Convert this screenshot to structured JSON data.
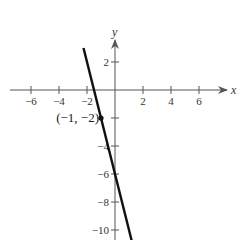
{
  "chart_data": {
    "type": "line",
    "title": "",
    "xlabel": "x",
    "ylabel": "y",
    "xlim": [
      -7.5,
      8
    ],
    "ylim": [
      -11,
      4
    ],
    "grid": false,
    "x_ticks": [
      -6,
      -4,
      -2,
      2,
      4,
      6
    ],
    "x_tick_labels": [
      "−6",
      "−4",
      "−2",
      "2",
      "4",
      "6"
    ],
    "y_ticks": [
      2,
      -4,
      -6,
      -8,
      -10
    ],
    "y_tick_labels": [
      "2",
      "−4",
      "−6",
      "−8",
      "−10"
    ],
    "series": [
      {
        "name": "line",
        "equation": "y = -4x - 6",
        "x": [
          -2.25,
          1.2
        ],
        "y": [
          3,
          -10.8
        ]
      }
    ],
    "annotations": [
      {
        "point": [
          -1,
          -2
        ],
        "label": "(−1, −2)"
      }
    ]
  },
  "colors": {
    "axis": "#555555",
    "line": "#111111",
    "text": "#333333"
  }
}
